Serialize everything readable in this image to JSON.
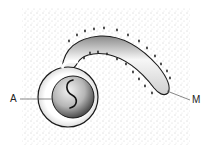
{
  "diagram": {
    "labels": [
      {
        "id": "A",
        "text": "A",
        "points_to": "inner spherical body"
      },
      {
        "id": "M",
        "text": "M",
        "points_to": "tip of curved tube"
      }
    ],
    "colors": {
      "background": "#ffffff",
      "stipple": "#9a9a9a",
      "outline": "#1a1a1a",
      "leader_line": "#555555"
    }
  }
}
